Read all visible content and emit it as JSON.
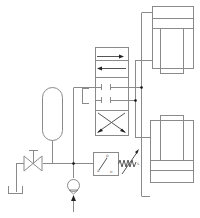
{
  "diagram": {
    "type": "hydraulic-schematic",
    "background": "#ffffff",
    "line_color": "#8a8a8a",
    "components": {
      "directional_valve": {
        "name": "4/3 directional control valve",
        "sections": [
          "parallel-arrows",
          "blocked-center",
          "crossed-arrows"
        ]
      },
      "accumulator": {
        "name": "accumulator"
      },
      "needle_valve": {
        "name": "shut-off valve"
      },
      "tank": {
        "name": "reservoir"
      },
      "pump": {
        "name": "pump"
      },
      "pressure_switch": {
        "name": "pressure switch",
        "labels": [
          "p",
          "o",
          "a"
        ]
      },
      "spring": {
        "name": "adjustable spring"
      },
      "cylinder_top": {
        "name": "hydraulic cylinder (upper)"
      },
      "cylinder_bottom": {
        "name": "hydraulic cylinder (lower)"
      }
    },
    "labels": {
      "switch_p": "p",
      "switch_o": "o",
      "switch_a": "a",
      "spring_s": "s"
    }
  }
}
